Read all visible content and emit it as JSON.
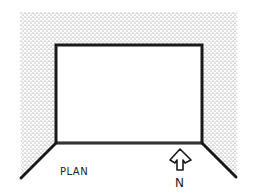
{
  "diagram": {
    "type": "architectural-plan",
    "labels": {
      "plan": "PLAN",
      "north": "N"
    },
    "colors": {
      "background": "#ffffff",
      "stipple": "#6b6b6b",
      "walls": "#1a1a1a"
    },
    "room": {
      "x": 56,
      "y": 45,
      "width": 146,
      "height": 98
    }
  }
}
